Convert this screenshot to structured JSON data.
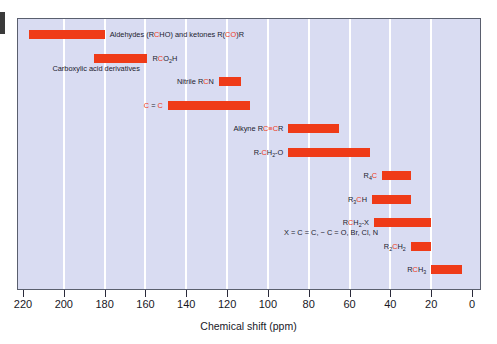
{
  "chart_data": {
    "type": "bar",
    "orientation": "horizontal-range",
    "title": "",
    "xlabel": "Chemical shift (ppm)",
    "ylabel": "",
    "xlim": [
      220,
      0
    ],
    "x_reversed": true,
    "grid": "vertical-white-every-20ppm",
    "legend": "none",
    "tick_labels": [
      "220",
      "200",
      "180",
      "160",
      "140",
      "120",
      "100",
      "80",
      "60",
      "40",
      "20",
      "0"
    ],
    "tick_values": [
      220,
      200,
      180,
      160,
      140,
      120,
      100,
      80,
      60,
      40,
      20,
      0
    ],
    "categories": [
      "Aldehydes (RCHO) and ketones R(CO)R",
      "RCO2H",
      "Nitrile RCN",
      "C=C",
      "Alkyne RC≡CR",
      "R-CH2-O",
      "R4C",
      "R3CH",
      "RCH2-X",
      "R2CH2",
      "RCH3"
    ],
    "ranges": [
      {
        "label": "Aldehydes (RCHO) and ketones R(CO)R",
        "start_ppm": 217,
        "end_ppm": 180
      },
      {
        "label": "RCO2H",
        "start_ppm": 185,
        "end_ppm": 159
      },
      {
        "label": "Nitrile RCN",
        "start_ppm": 124,
        "end_ppm": 113
      },
      {
        "label": "C=C",
        "start_ppm": 149,
        "end_ppm": 109
      },
      {
        "label": "Alkyne RC≡CR",
        "start_ppm": 90,
        "end_ppm": 65
      },
      {
        "label": "R-CH2-O",
        "start_ppm": 90,
        "end_ppm": 50
      },
      {
        "label": "R4C",
        "start_ppm": 44,
        "end_ppm": 30
      },
      {
        "label": "R3CH",
        "start_ppm": 49,
        "end_ppm": 30
      },
      {
        "label": "RCH2-X",
        "start_ppm": 48,
        "end_ppm": 20
      },
      {
        "label": "R2CH2",
        "start_ppm": 30,
        "end_ppm": 20
      },
      {
        "label": "RCH3",
        "start_ppm": 20,
        "end_ppm": 5
      }
    ],
    "series": [
      {
        "name": "chemical shift range",
        "color": "#ef3b18"
      }
    ],
    "colors": {
      "bar": "#ef3b18",
      "plot_background": "#d9dcf2",
      "gridline": "#ffffff",
      "frame": "#5a5f6e",
      "text": "#1b1b2e",
      "highlight_text": "#ef3b18"
    }
  },
  "axis": {
    "title": "Chemical shift (ppm)",
    "ticks": [
      "220",
      "200",
      "180",
      "160",
      "140",
      "120",
      "100",
      "80",
      "60",
      "40",
      "20",
      "0"
    ]
  },
  "rows": [
    {
      "id": "aldehydes-ketones",
      "label_html": "Aldehydes (R<span class=\"hl\">C</span>HO) and ketones R(<span class=\"hl\">CO</span>)R",
      "label_plain": "Aldehydes (RCHO) and ketones R(CO)R",
      "sub_label": "",
      "start_ppm": 217,
      "end_ppm": 180,
      "label_side": "right"
    },
    {
      "id": "carboxylic-acid",
      "label_html": "R<span class=\"hl\">C</span>O<sub>2</sub>H",
      "label_plain": "RCO2H",
      "sub_label": "Carboxylic acid derivatives",
      "start_ppm": 185,
      "end_ppm": 159,
      "label_side": "right"
    },
    {
      "id": "nitrile",
      "label_html": "Nitrile R<span class=\"hl\">C</span>N",
      "label_plain": "Nitrile RCN",
      "sub_label": "",
      "start_ppm": 124,
      "end_ppm": 113,
      "label_side": "left"
    },
    {
      "id": "alkene",
      "label_html": "<span class=\"hl\">C</span> = <span class=\"hl\">C</span>",
      "label_plain": "C = C",
      "sub_label": "",
      "start_ppm": 149,
      "end_ppm": 109,
      "label_side": "left"
    },
    {
      "id": "alkyne",
      "label_html": "Alkyne R<span class=\"hl\">C</span><span class=\"hl\">≡</span><span class=\"hl\">C</span>R",
      "label_plain": "Alkyne RC≡CR",
      "sub_label": "",
      "start_ppm": 90,
      "end_ppm": 65,
      "label_side": "left"
    },
    {
      "id": "alkoxy",
      "label_html": "R-<span class=\"hl\">C</span>H<sub>2</sub>-O",
      "label_plain": "R-CH2-O",
      "sub_label": "",
      "start_ppm": 90,
      "end_ppm": 50,
      "label_side": "left"
    },
    {
      "id": "quaternary-carbon",
      "label_html": "R<sub>4</sub><span class=\"hl\">C</span>",
      "label_plain": "R4C",
      "sub_label": "",
      "start_ppm": 44,
      "end_ppm": 30,
      "label_side": "left"
    },
    {
      "id": "methine",
      "label_html": "R<sub>3</sub><span class=\"hl\">C</span>H",
      "label_plain": "R3CH",
      "sub_label": "",
      "start_ppm": 49,
      "end_ppm": 30,
      "label_side": "left"
    },
    {
      "id": "methylene-x",
      "label_html": "R<span class=\"hl\">C</span>H<sub>2</sub>-X",
      "label_plain": "RCH2-X",
      "sub_label": "X = C = C, − C = O, Br, Cl, N",
      "start_ppm": 48,
      "end_ppm": 20,
      "label_side": "left"
    },
    {
      "id": "methylene",
      "label_html": "R<sub>2</sub><span class=\"hl\">C</span>H<sub>2</sub>",
      "label_plain": "R2CH2",
      "sub_label": "",
      "start_ppm": 30,
      "end_ppm": 20,
      "label_side": "left"
    },
    {
      "id": "methyl",
      "label_html": "R<span class=\"hl\">C</span>H<sub>3</sub>",
      "label_plain": "RCH3",
      "sub_label": "",
      "start_ppm": 20,
      "end_ppm": 5,
      "label_side": "left"
    }
  ]
}
